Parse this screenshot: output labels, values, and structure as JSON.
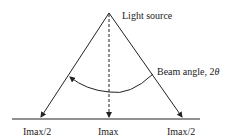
{
  "diagram": {
    "labels": {
      "source": "Light source",
      "beam_angle": "Beam angle, 2",
      "beam_angle_symbol": "θ",
      "left": "Imax/2",
      "center": "Imax",
      "right": "Imax/2"
    },
    "colors": {
      "line": "#222222",
      "background": "#ffffff"
    }
  }
}
